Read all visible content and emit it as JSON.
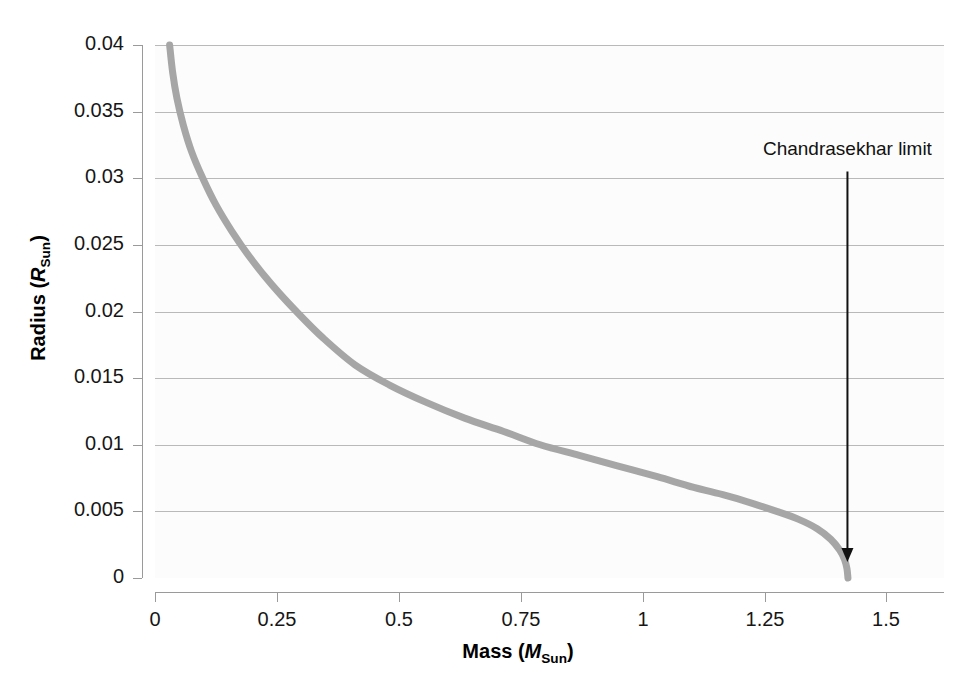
{
  "figure": {
    "background_color": "#ffffff",
    "plot_background_color": "#fcfcfc",
    "gridline_color": "#b9b9b9",
    "axis_color": "#9a9a9a",
    "curve_color": "#a6a6a6",
    "annotation_color": "#111111"
  },
  "chart_data": {
    "type": "line",
    "title": "",
    "subtitle": "",
    "xlabel": "Mass (MSun)",
    "ylabel": "Radius (RSun)",
    "xlabel_parts": {
      "text": "Mass",
      "symbol": "M",
      "subscript": "Sun"
    },
    "ylabel_parts": {
      "text": "Radius",
      "symbol": "R",
      "subscript": "Sun"
    },
    "xlim": [
      0,
      1.618
    ],
    "ylim": [
      0,
      0.04
    ],
    "xticks": [
      0,
      0.25,
      0.5,
      0.75,
      1,
      1.25,
      1.5
    ],
    "xticklabels": [
      "0",
      "0.25",
      "0.5",
      "0.75",
      "1",
      "1.25",
      "1.5"
    ],
    "yticks": [
      0,
      0.005,
      0.01,
      0.015,
      0.02,
      0.025,
      0.03,
      0.035,
      0.04
    ],
    "yticklabels": [
      "0",
      "0.005",
      "0.01",
      "0.015",
      "0.02",
      "0.025",
      "0.03",
      "0.035",
      "0.04"
    ],
    "grid": "horizontal",
    "legend": "none",
    "series": [
      {
        "name": "White dwarf mass-radius relation",
        "color": "#a6a6a6",
        "linewidth": 7,
        "x": [
          0.03,
          0.036,
          0.045,
          0.058,
          0.075,
          0.098,
          0.125,
          0.158,
          0.196,
          0.24,
          0.29,
          0.345,
          0.41,
          0.48,
          0.555,
          0.635,
          0.715,
          0.79,
          0.87,
          0.95,
          1.03,
          1.105,
          1.17,
          1.225,
          1.275,
          1.32,
          1.358,
          1.386,
          1.404,
          1.414,
          1.419,
          1.421
        ],
        "y": [
          0.04,
          0.038,
          0.036,
          0.034,
          0.032,
          0.03,
          0.028,
          0.026,
          0.024,
          0.022,
          0.02,
          0.018,
          0.016,
          0.0145,
          0.0132,
          0.012,
          0.011,
          0.01,
          0.0092,
          0.0084,
          0.0076,
          0.0068,
          0.0062,
          0.0056,
          0.005,
          0.0044,
          0.0037,
          0.0029,
          0.0021,
          0.0014,
          0.0007,
          0.0
        ]
      }
    ],
    "annotations": [
      {
        "text": "Chandrasekhar limit",
        "x_value": 1.42,
        "arrow": "down",
        "arrow_from_y": 0.0305,
        "arrow_to_y": 0.0012
      }
    ]
  }
}
